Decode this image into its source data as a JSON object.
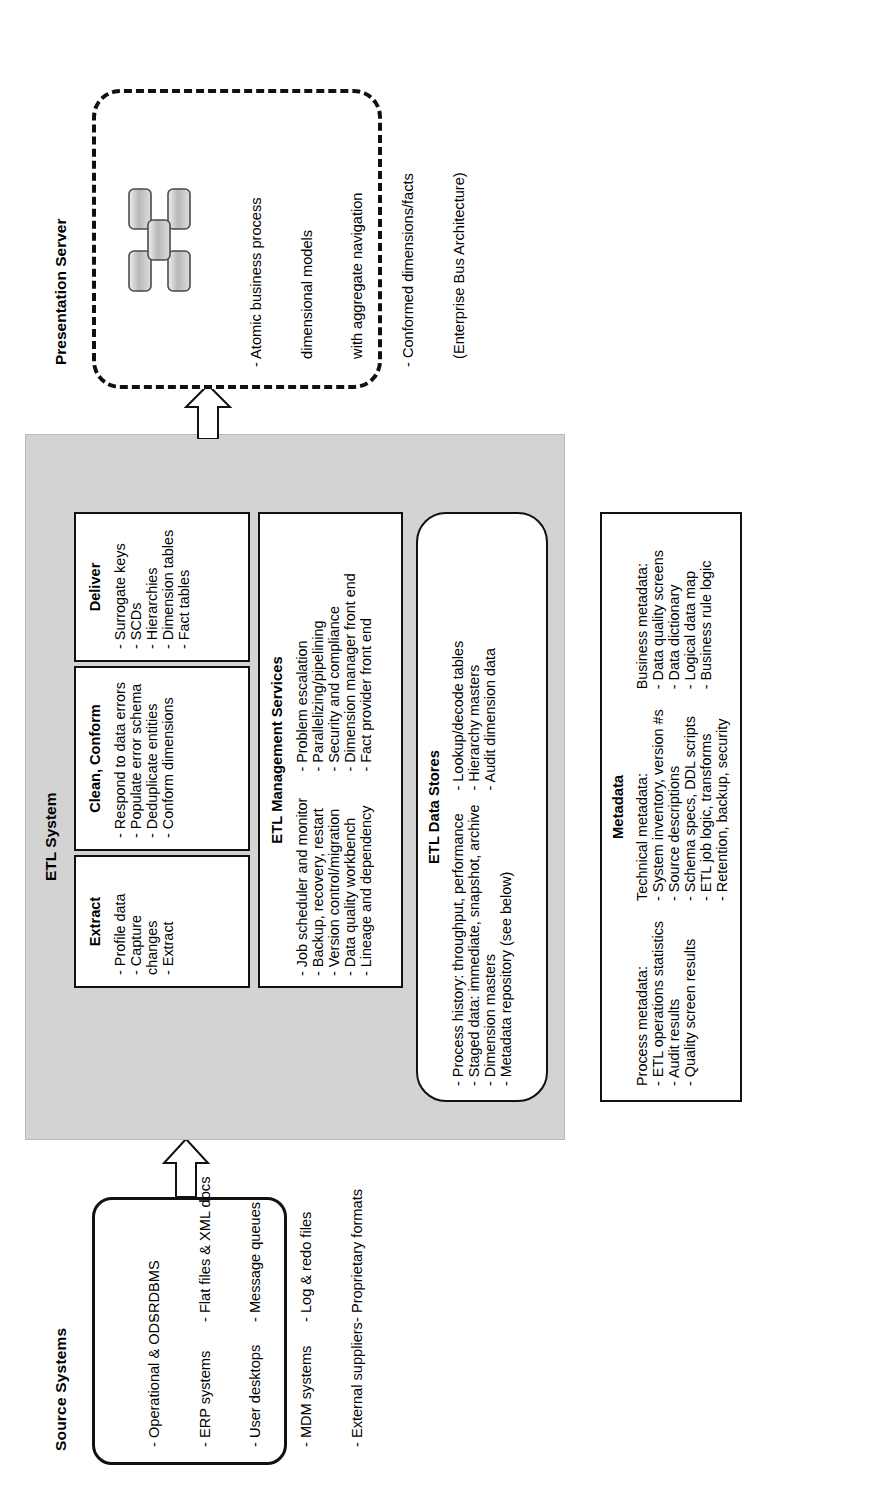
{
  "diagram": {
    "orientation": "landscape-on-portrait-page-rotated-90ccw"
  },
  "source_systems": {
    "title": "Source Systems",
    "column_a": [
      "- Operational & ODS",
      "- ERP systems",
      "- User desktops",
      "- MDM systems",
      "- External suppliers"
    ],
    "column_b": [
      "- RDBMS",
      "- Flat files & XML docs",
      "- Message queues",
      "- Log & redo files",
      "- Proprietary formats"
    ]
  },
  "etl_system": {
    "title": "ETL System",
    "extract": {
      "title": "Extract",
      "items": [
        "- Profile data",
        "- Capture",
        "  changes",
        "- Extract"
      ]
    },
    "clean_conform": {
      "title": "Clean, Conform",
      "items": [
        "- Respond to data errors",
        "- Populate error schema",
        "- Deduplicate entities",
        "- Conform dimensions"
      ]
    },
    "deliver": {
      "title": "Deliver",
      "items": [
        "- Surrogate keys",
        "- SCDs",
        "- Hierarchies",
        "- Dimension tables",
        "- Fact tables"
      ]
    },
    "management_services": {
      "title": "ETL Management Services",
      "column_a": [
        "- Job scheduler and monitor",
        "- Backup, recovery, restart",
        "- Version control/migration",
        "- Data quality workbench",
        "- Lineage and dependency"
      ],
      "column_b": [
        "- Problem escalation",
        "- Parallelizing/pipelining",
        "- Security and compliance",
        "- Dimension manager front end",
        "- Fact provider front end"
      ]
    },
    "data_stores": {
      "title": "ETL Data Stores",
      "column_a": [
        "- Process history: throughput, performance",
        "- Staged data: immediate, snapshot, archive",
        "- Dimension masters",
        "- Metadata repository (see below)"
      ],
      "column_b": [
        "- Lookup/decode tables",
        "- Hierarchy masters",
        "- Audit dimension data"
      ]
    }
  },
  "metadata": {
    "title": "Metadata",
    "process": {
      "heading": "Process metadata:",
      "items": [
        "- ETL operations statistics",
        "- Audit results",
        "- Quality screen results"
      ]
    },
    "technical": {
      "heading": "Technical metadata:",
      "items": [
        "- System inventory, version #s",
        "- Source descriptions",
        "- Schema specs, DDL scripts",
        "- ETL job logic, transforms",
        "- Retention, backup, security"
      ]
    },
    "business": {
      "heading": "Business metadata:",
      "items": [
        "- Data quality screens",
        "- Data dictionary",
        "- Logical data map",
        "- Business rule logic"
      ]
    }
  },
  "presentation_server": {
    "title": "Presentation Server",
    "items": [
      "- Atomic business process",
      "  dimensional models",
      "  with aggregate navigation",
      "- Conformed dimensions/facts",
      "  (Enterprise Bus Architecture)"
    ],
    "glyph": "star-schema-icon"
  },
  "flows": [
    {
      "name": "source-to-etl",
      "from": "Source Systems",
      "to": "ETL System"
    },
    {
      "name": "etl-to-presentation",
      "from": "ETL System",
      "to": "Presentation Server"
    }
  ],
  "colors": {
    "panel_fill": "#d3d3d3",
    "box_fill": "#ffffff",
    "line": "#111111",
    "glyph_fill": "#c9c9c9"
  }
}
